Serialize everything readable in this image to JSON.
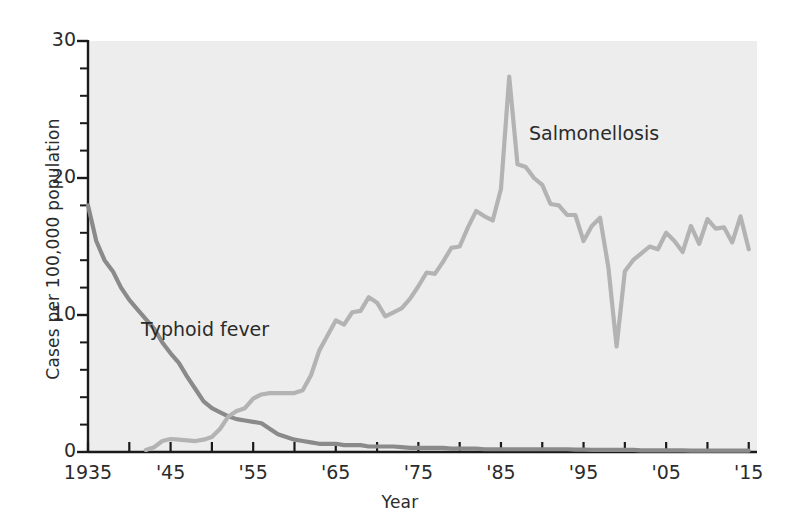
{
  "chart_data": {
    "type": "line",
    "title": "",
    "xlabel": "Year",
    "ylabel": "Cases per 100,000 population",
    "xlim": [
      1935,
      2016
    ],
    "ylim": [
      0,
      30
    ],
    "ytick_labels": [
      "0",
      "10",
      "20",
      "30"
    ],
    "ytick_values": [
      0,
      10,
      20,
      30
    ],
    "ytick_minor_step": 2,
    "xtick_labels": [
      "1935",
      "'45",
      "'55",
      "'65",
      "'75",
      "'85",
      "'95",
      "'05",
      "'15"
    ],
    "xtick_values": [
      1935,
      1945,
      1955,
      1965,
      1975,
      1985,
      1995,
      2005,
      2015
    ],
    "xtick_minor_step": 5,
    "grid": false,
    "legend": "inline-annotations",
    "background": "#ededed",
    "series": [
      {
        "name": "Typhoid fever",
        "color": "#8a8a8a",
        "label_position": "inside-left",
        "x": [
          1935,
          1936,
          1937,
          1938,
          1939,
          1940,
          1941,
          1942,
          1943,
          1944,
          1945,
          1946,
          1947,
          1948,
          1949,
          1950,
          1951,
          1952,
          1953,
          1954,
          1955,
          1956,
          1957,
          1958,
          1959,
          1960,
          1961,
          1962,
          1963,
          1964,
          1965,
          1966,
          1967,
          1968,
          1969,
          1970,
          1971,
          1972,
          1973,
          1974,
          1975,
          1976,
          1977,
          1978,
          1979,
          1980,
          1981,
          1982,
          1983,
          1984,
          1985,
          1986,
          1987,
          1988,
          1989,
          1990,
          1991,
          1992,
          1993,
          1994,
          1995,
          1996,
          1997,
          1998,
          1999,
          2000,
          2001,
          2002,
          2003,
          2004,
          2005,
          2006,
          2007,
          2008,
          2009,
          2010,
          2011,
          2012,
          2013,
          2014,
          2015
        ],
        "y": [
          18.0,
          15.4,
          14.0,
          13.2,
          12.0,
          11.1,
          10.4,
          9.7,
          9.0,
          8.0,
          7.2,
          6.5,
          5.5,
          4.6,
          3.7,
          3.2,
          2.9,
          2.6,
          2.4,
          2.3,
          2.2,
          2.1,
          1.7,
          1.3,
          1.1,
          0.9,
          0.8,
          0.7,
          0.6,
          0.6,
          0.6,
          0.5,
          0.5,
          0.5,
          0.4,
          0.4,
          0.4,
          0.4,
          0.35,
          0.3,
          0.3,
          0.3,
          0.3,
          0.3,
          0.25,
          0.25,
          0.25,
          0.25,
          0.2,
          0.2,
          0.2,
          0.2,
          0.2,
          0.2,
          0.2,
          0.2,
          0.2,
          0.2,
          0.2,
          0.18,
          0.18,
          0.15,
          0.15,
          0.15,
          0.15,
          0.15,
          0.15,
          0.12,
          0.12,
          0.12,
          0.12,
          0.12,
          0.12,
          0.1,
          0.1,
          0.1,
          0.1,
          0.1,
          0.1,
          0.1,
          0.1
        ]
      },
      {
        "name": "Salmonellosis",
        "color": "#b3b3b3",
        "label_position": "upper-right",
        "x": [
          1942,
          1943,
          1944,
          1945,
          1946,
          1947,
          1948,
          1949,
          1950,
          1951,
          1952,
          1953,
          1954,
          1955,
          1956,
          1957,
          1958,
          1959,
          1960,
          1961,
          1962,
          1963,
          1964,
          1965,
          1966,
          1967,
          1968,
          1969,
          1970,
          1971,
          1972,
          1973,
          1974,
          1975,
          1976,
          1977,
          1978,
          1979,
          1980,
          1981,
          1982,
          1983,
          1984,
          1985,
          1986,
          1987,
          1988,
          1989,
          1990,
          1991,
          1992,
          1993,
          1994,
          1995,
          1996,
          1997,
          1998,
          1999,
          2000,
          2001,
          2002,
          2003,
          2004,
          2005,
          2006,
          2007,
          2008,
          2009,
          2010,
          2011,
          2012,
          2013,
          2014,
          2015
        ],
        "y": [
          0.15,
          0.35,
          0.8,
          0.95,
          0.9,
          0.85,
          0.8,
          0.9,
          1.1,
          1.7,
          2.6,
          3.0,
          3.2,
          3.9,
          4.2,
          4.3,
          4.3,
          4.3,
          4.3,
          4.5,
          5.6,
          7.4,
          8.5,
          9.6,
          9.3,
          10.2,
          10.3,
          11.3,
          10.9,
          9.9,
          10.2,
          10.5,
          11.2,
          12.1,
          13.1,
          13.0,
          13.9,
          14.9,
          15.0,
          16.4,
          17.6,
          17.2,
          16.9,
          19.2,
          27.4,
          21.0,
          20.8,
          20.0,
          19.5,
          18.1,
          18.0,
          17.3,
          17.3,
          15.4,
          16.5,
          17.1,
          13.5,
          7.7,
          13.2,
          14.0,
          14.5,
          15.0,
          14.8,
          16.0,
          15.4,
          14.6,
          16.5,
          15.2,
          17.0,
          16.3,
          16.4,
          15.3,
          17.2,
          14.8
        ]
      }
    ],
    "annotations": [
      {
        "text": "Typhoid fever",
        "x": 1940,
        "y": 9.8
      },
      {
        "text": "Salmonellosis",
        "x": 1990,
        "y": 24.0
      }
    ]
  },
  "axis": {
    "ylabel": "Cases per 100,000 population",
    "xlabel": "Year"
  },
  "labels": {
    "typhoid": "Typhoid fever",
    "salmonellosis": "Salmonellosis"
  }
}
